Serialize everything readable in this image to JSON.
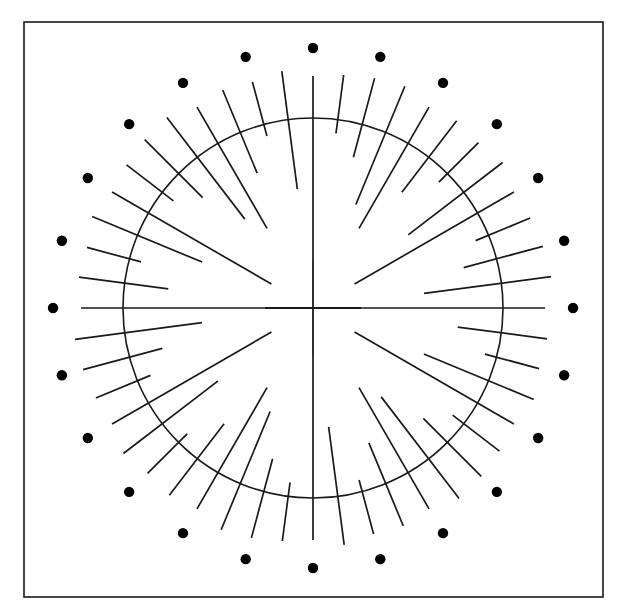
{
  "figure": {
    "canvas": {
      "width": 626,
      "height": 615,
      "background": "#ffffff"
    },
    "ink_color": "#1a1a1a",
    "dot_color": "#000000"
  },
  "frame": {
    "label": "border-rectangle",
    "x": 24,
    "y": 22,
    "width": 579,
    "height": 575,
    "stroke_width": 1.6
  },
  "center": {
    "label": "diagram-center",
    "cx": 313,
    "cy": 308
  },
  "circle": {
    "label": "main-circle",
    "radius": 190,
    "stroke_width": 1.6
  },
  "center_cross": {
    "label": "center-crosshair",
    "arm_length": 48,
    "stroke_width": 1.8,
    "arms": [
      {
        "name": "cross-arm-up",
        "dx": 0,
        "dy": -1
      },
      {
        "name": "cross-arm-down",
        "dx": 0,
        "dy": 1
      },
      {
        "name": "cross-arm-left",
        "dx": -1,
        "dy": 0
      },
      {
        "name": "cross-arm-right",
        "dx": 1,
        "dy": 0
      }
    ]
  },
  "dot_ring": {
    "label": "outer-dot-ring",
    "count": 24,
    "radius": 260,
    "dot_radius": 5.2,
    "start_angle_deg": 90,
    "step_deg": 15,
    "angles_deg": [
      90,
      105,
      120,
      135,
      150,
      165,
      180,
      195,
      210,
      225,
      240,
      255,
      270,
      285,
      300,
      315,
      330,
      345,
      0,
      15,
      30,
      45,
      60,
      75
    ]
  },
  "spokes": {
    "label": "radial-spokes",
    "count": 48,
    "step_deg": 7.5,
    "start_angle_deg": 90,
    "stroke_width": 1.7,
    "length_pattern_note": "Repeating group of 8 spoke lengths; r0 = inner radius, r1 = outer radius, both measured from center in pixels.",
    "pattern": [
      {
        "name": "spoke-axis-long",
        "r0": 0,
        "r1": 232
      },
      {
        "name": "spoke-short-outer",
        "r0": 176,
        "r1": 235
      },
      {
        "name": "spoke-medium",
        "r0": 156,
        "r1": 238
      },
      {
        "name": "spoke-long-cross",
        "r0": 112,
        "r1": 240
      },
      {
        "name": "spoke-long-inner",
        "r0": 92,
        "r1": 232
      },
      {
        "name": "spoke-medium-2",
        "r0": 146,
        "r1": 236
      },
      {
        "name": "spoke-short-outer-2",
        "r0": 178,
        "r1": 234
      },
      {
        "name": "spoke-long-cross-2",
        "r0": 120,
        "r1": 239
      }
    ],
    "axis_spokes_deg": [
      0,
      90,
      180,
      270
    ],
    "axis_inner_radius": 48,
    "axis_outer_radius": 232
  }
}
